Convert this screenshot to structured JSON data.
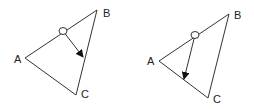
{
  "diagrams": [
    {
      "labels": {
        "A": "A",
        "B": "B",
        "C": "C"
      },
      "vertices": {
        "A": [
          25,
          58
        ],
        "B": [
          97,
          10
        ],
        "C": [
          76,
          95
        ]
      },
      "pivot": [
        63,
        31
      ],
      "arrow_end": [
        83,
        57
      ]
    },
    {
      "labels": {
        "A": "A",
        "B": "B",
        "C": "C"
      },
      "vertices": {
        "A": [
          159,
          61
        ],
        "B": [
          229,
          14
        ],
        "C": [
          208,
          98
        ]
      },
      "pivot": [
        195,
        35
      ],
      "arrow_end": [
        184,
        79
      ]
    }
  ],
  "colors": {
    "stroke": "#333333",
    "background": "#ffffff"
  }
}
